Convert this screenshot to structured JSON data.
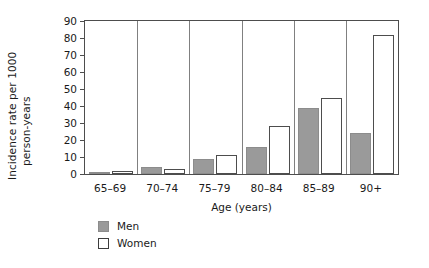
{
  "chart_data": {
    "type": "bar",
    "title": "",
    "xlabel": "Age (years)",
    "ylabel": "Incidence rate per 1000 person-years",
    "ylabel_line1": "Incidence rate per 1000",
    "ylabel_line2": "person-years",
    "categories": [
      "65–69",
      "70–74",
      "75–79",
      "80–84",
      "85–89",
      "90+"
    ],
    "series": [
      {
        "name": "Men",
        "color": "#9a9a9a",
        "values": [
          1,
          4,
          9,
          16,
          39,
          24
        ]
      },
      {
        "name": "Women",
        "color": "#ffffff",
        "values": [
          2,
          3,
          11,
          28,
          45,
          82
        ]
      }
    ],
    "ylim": [
      0,
      90
    ],
    "yticks": [
      0,
      10,
      20,
      30,
      40,
      50,
      60,
      70,
      80,
      90
    ],
    "ytick_labels": [
      "0",
      "10",
      "20",
      "30",
      "40",
      "50",
      "60",
      "70",
      "80",
      "90"
    ],
    "grid": false,
    "legend_position": "below-left",
    "legend": [
      {
        "label": "Men",
        "swatch": "filled-gray"
      },
      {
        "label": "Women",
        "swatch": "outlined-white"
      }
    ]
  }
}
